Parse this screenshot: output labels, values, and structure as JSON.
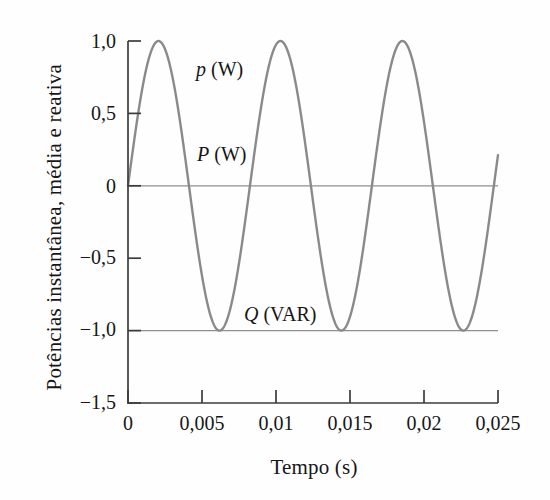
{
  "chart_data": {
    "type": "line",
    "title": "",
    "xlabel": "Tempo (s)",
    "ylabel": "Potências instantânea, média e reativa",
    "xlim": [
      0,
      0.025
    ],
    "ylim": [
      -1.5,
      1.0
    ],
    "grid": false,
    "legend_position": "inline-annotations",
    "xticks": [
      0,
      0.005,
      0.01,
      0.015,
      0.02,
      0.025
    ],
    "xticklabels": [
      "0",
      "0,005",
      "0,01",
      "0,015",
      "0,02",
      "0,025"
    ],
    "yticks": [
      1.0,
      0.5,
      0,
      -0.5,
      -1.0,
      -1.5
    ],
    "yticklabels": [
      "1,0",
      "0,5",
      "0",
      "−0,5",
      "−1,0",
      "−1,5"
    ],
    "series": [
      {
        "name": "p (W)",
        "label_html": "<i>p</i> (W)",
        "kind": "sinusoid",
        "description": "Potência instantânea, senoide de amplitude 1,0 partindo de zero",
        "amplitude": 1.0,
        "offset": 0.0,
        "period": 0.00824,
        "phase": 0.0,
        "color": "#8a8a8a",
        "linewidth": 2.4,
        "label_x": 0.0053,
        "label_y": 0.78
      },
      {
        "name": "P (W)",
        "label_html": "<i>P</i> (W)",
        "kind": "horizontal-line",
        "description": "Potência média constante em 0",
        "value": 0.0,
        "color": "#8f8f8f",
        "linewidth": 1.2,
        "label_x": 0.0055,
        "label_y": 0.17
      },
      {
        "name": "Q (VAR)",
        "label_html": "<i>Q</i> (VAR)",
        "kind": "horizontal-line",
        "description": "Potência reativa constante em −1,0",
        "value": -1.0,
        "color": "#8f8f8f",
        "linewidth": 1.2,
        "label_x": 0.0106,
        "label_y": -0.83
      }
    ],
    "annotations": [
      {
        "text": "p (W)",
        "x": 0.0053,
        "y": 0.78
      },
      {
        "text": "P (W)",
        "x": 0.0055,
        "y": 0.17
      },
      {
        "text": "Q (VAR)",
        "x": 0.0106,
        "y": -0.83
      }
    ],
    "axis_color": "#3c3c3c",
    "text_color": "#161616",
    "background": "#fefefe"
  },
  "labels": {
    "ylabel": "Potências instantânea, média e reativa",
    "xlabel": "Tempo (s)",
    "ytick0": "1,0",
    "ytick1": "0,5",
    "ytick2": "0",
    "ytick3": "−0,5",
    "ytick4": "−1,0",
    "ytick5": "−1,5",
    "xtick0": "0",
    "xtick1": "0,005",
    "xtick2": "0,01",
    "xtick3": "0,015",
    "xtick4": "0,02",
    "xtick5": "0,025",
    "series_p": "p (W)",
    "series_P": "P (W)",
    "series_Q": "Q (VAR)"
  }
}
